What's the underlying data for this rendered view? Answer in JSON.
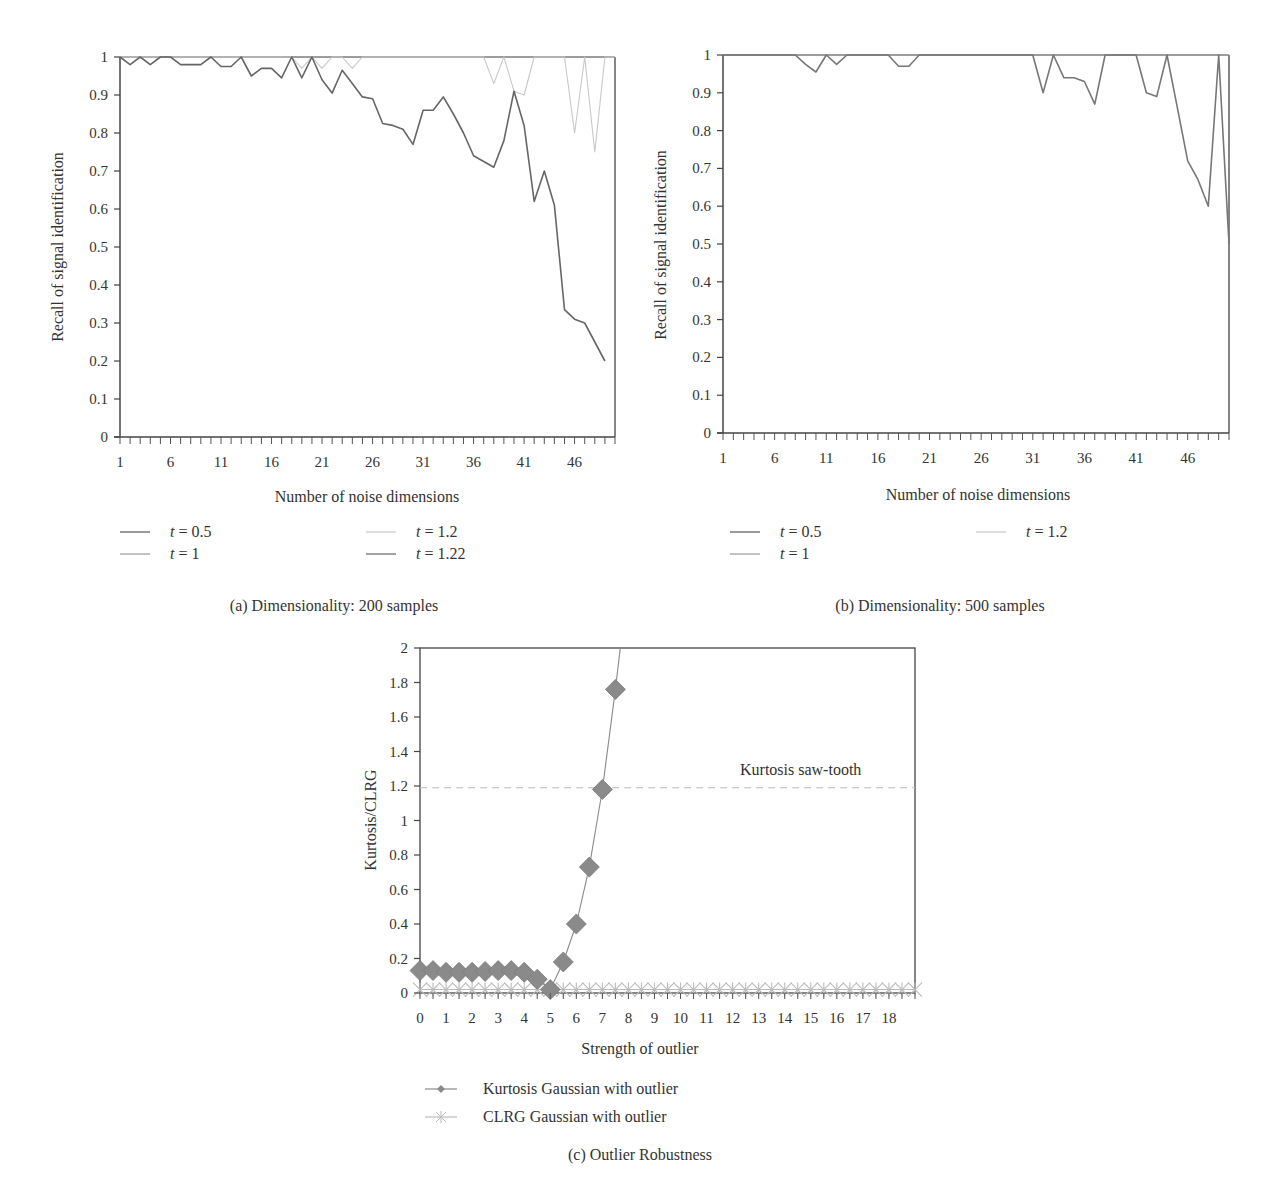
{
  "chart_data": [
    {
      "id": "a",
      "type": "line",
      "caption": "(a)  Dimensionality: 200 samples",
      "xlabel": "Number of noise dimensions",
      "ylabel": "Recall of signal identification",
      "xlim": [
        1,
        50
      ],
      "ylim": [
        0,
        1
      ],
      "x_tick_labels": [
        "1",
        "6",
        "11",
        "16",
        "21",
        "26",
        "31",
        "36",
        "41",
        "46"
      ],
      "y_tick_labels": [
        "0",
        "0.1",
        "0.2",
        "0.3",
        "0.4",
        "0.5",
        "0.6",
        "0.7",
        "0.8",
        "0.9",
        "1"
      ],
      "x": [
        1,
        2,
        3,
        4,
        5,
        6,
        7,
        8,
        9,
        10,
        11,
        12,
        13,
        14,
        15,
        16,
        17,
        18,
        19,
        20,
        21,
        22,
        23,
        24,
        25,
        26,
        27,
        28,
        29,
        30,
        31,
        32,
        33,
        34,
        35,
        36,
        37,
        38,
        39,
        40,
        41,
        42,
        43,
        44,
        45,
        46,
        47,
        48,
        49,
        50
      ],
      "legend": [
        {
          "label_var": "t",
          "label_value": " = 0.5",
          "color": "#555555"
        },
        {
          "label_var": "t",
          "label_value": " = 1",
          "color": "#999999"
        },
        {
          "label_var": "t",
          "label_value": " = 1.2",
          "color": "#c8c8c8"
        },
        {
          "label_var": "t",
          "label_value": " = 1.22",
          "color": "#666666"
        }
      ],
      "series": [
        {
          "name": "t = 0.5",
          "color": "#555555",
          "values": [
            1,
            1,
            1,
            1,
            1,
            1,
            1,
            1,
            1,
            1,
            1,
            1,
            1,
            1,
            1,
            1,
            1,
            1,
            1,
            1,
            1,
            1,
            1,
            1,
            1,
            1,
            1,
            1,
            1,
            1,
            1,
            1,
            1,
            1,
            1,
            1,
            1,
            1,
            1,
            1,
            1,
            1,
            1,
            1,
            1,
            1,
            1,
            1,
            1,
            1
          ]
        },
        {
          "name": "t = 1",
          "color": "#999999",
          "values": [
            1,
            1,
            1,
            1,
            1,
            1,
            1,
            1,
            1,
            1,
            1,
            1,
            1,
            1,
            1,
            1,
            1,
            1,
            1,
            1,
            1,
            1,
            1,
            1,
            1,
            1,
            1,
            1,
            1,
            1,
            1,
            1,
            1,
            1,
            1,
            1,
            1,
            1,
            1,
            1,
            1,
            1,
            1,
            1,
            1,
            1,
            1,
            1,
            1,
            1
          ]
        },
        {
          "name": "t = 1.2",
          "color": "#c8c8c8",
          "values": [
            1,
            1,
            1,
            1,
            1,
            1,
            1,
            1,
            1,
            1,
            1,
            1,
            1,
            1,
            1,
            1,
            1,
            1,
            0.97,
            1,
            0.97,
            1,
            1,
            0.97,
            1,
            1,
            1,
            1,
            1,
            1,
            1,
            1,
            1,
            1,
            1,
            1,
            1,
            0.93,
            1,
            0.91,
            0.9,
            1,
            1,
            1,
            1,
            0.8,
            1,
            0.75,
            1,
            1
          ]
        },
        {
          "name": "t = 1.22",
          "color": "#666666",
          "values": [
            1,
            0.98,
            1,
            0.98,
            1,
            1,
            0.98,
            0.98,
            0.98,
            1,
            0.975,
            0.975,
            1,
            0.95,
            0.97,
            0.97,
            0.945,
            1,
            0.945,
            1,
            0.94,
            0.905,
            0.965,
            0.93,
            0.895,
            0.89,
            0.825,
            0.82,
            0.81,
            0.77,
            0.86,
            0.86,
            0.895,
            0.85,
            0.8,
            0.74,
            0.725,
            0.71,
            0.78,
            0.91,
            0.82,
            0.62,
            0.7,
            0.61,
            0.335,
            0.31,
            0.3,
            0.25,
            0.2,
            null
          ]
        }
      ]
    },
    {
      "id": "b",
      "type": "line",
      "caption": "(b)  Dimensionality: 500 samples",
      "xlabel": "Number of noise dimensions",
      "ylabel": "Recall of signal identification",
      "xlim": [
        1,
        50
      ],
      "ylim": [
        0,
        1
      ],
      "x_tick_labels": [
        "1",
        "6",
        "11",
        "16",
        "21",
        "26",
        "31",
        "36",
        "41",
        "46"
      ],
      "y_tick_labels": [
        "0",
        "0.1",
        "0.2",
        "0.3",
        "0.4",
        "0.5",
        "0.6",
        "0.7",
        "0.8",
        "0.9",
        "1"
      ],
      "x": [
        1,
        2,
        3,
        4,
        5,
        6,
        7,
        8,
        9,
        10,
        11,
        12,
        13,
        14,
        15,
        16,
        17,
        18,
        19,
        20,
        21,
        22,
        23,
        24,
        25,
        26,
        27,
        28,
        29,
        30,
        31,
        32,
        33,
        34,
        35,
        36,
        37,
        38,
        39,
        40,
        41,
        42,
        43,
        44,
        45,
        46,
        47,
        48,
        49,
        50
      ],
      "legend": [
        {
          "label_var": "t",
          "label_value": " = 0.5",
          "color": "#555555"
        },
        {
          "label_var": "t",
          "label_value": " = 1",
          "color": "#999999"
        },
        {
          "label_var": "t",
          "label_value": " = 1.2",
          "color": "#c8c8c8"
        }
      ],
      "series": [
        {
          "name": "t = 0.5",
          "color": "#555555",
          "values": [
            1,
            1,
            1,
            1,
            1,
            1,
            1,
            1,
            1,
            1,
            1,
            1,
            1,
            1,
            1,
            1,
            1,
            1,
            1,
            1,
            1,
            1,
            1,
            1,
            1,
            1,
            1,
            1,
            1,
            1,
            1,
            1,
            1,
            1,
            1,
            1,
            1,
            1,
            1,
            1,
            1,
            1,
            1,
            1,
            1,
            1,
            1,
            1,
            1,
            1
          ]
        },
        {
          "name": "t = 1",
          "color": "#999999",
          "values": [
            1,
            1,
            1,
            1,
            1,
            1,
            1,
            1,
            1,
            1,
            1,
            1,
            1,
            1,
            1,
            1,
            1,
            1,
            1,
            1,
            1,
            1,
            1,
            1,
            1,
            1,
            1,
            1,
            1,
            1,
            1,
            1,
            1,
            1,
            1,
            1,
            1,
            1,
            1,
            1,
            1,
            1,
            1,
            1,
            1,
            1,
            1,
            1,
            1,
            1
          ]
        },
        {
          "name": "t = 1.2",
          "color": "#777777",
          "values": [
            1,
            1,
            1,
            1,
            1,
            1,
            1,
            1,
            0.975,
            0.955,
            1,
            0.975,
            1,
            1,
            1,
            1,
            1,
            0.97,
            0.97,
            1,
            1,
            1,
            1,
            1,
            1,
            1,
            1,
            1,
            1,
            1,
            1,
            0.9,
            1,
            0.94,
            0.94,
            0.93,
            0.87,
            1,
            1,
            1,
            1,
            0.9,
            0.89,
            1,
            0.86,
            0.72,
            0.67,
            0.6,
            1,
            0.5
          ]
        }
      ]
    },
    {
      "id": "c",
      "type": "line",
      "caption": "(c)  Outlier Robustness",
      "xlabel": "Strength of outlier",
      "ylabel": "Kurtosis/CLRG",
      "xlim": [
        0,
        19
      ],
      "ylim": [
        0,
        2
      ],
      "x_tick_labels": [
        "0",
        "1",
        "2",
        "3",
        "4",
        "5",
        "6",
        "7",
        "8",
        "9",
        "10",
        "11",
        "12",
        "13",
        "14",
        "15",
        "16",
        "17",
        "18"
      ],
      "y_tick_labels": [
        "0",
        "0.2",
        "0.4",
        "0.6",
        "0.8",
        "1",
        "1.2",
        "1.4",
        "1.6",
        "1.8",
        "2"
      ],
      "annotation": {
        "text": "Kurtosis saw-tooth",
        "y": 1.19,
        "color": "#bbbbbb"
      },
      "legend": [
        {
          "label": "Kurtosis Gaussian with outlier",
          "marker": "diamond",
          "color": "#8a8a8a"
        },
        {
          "label": "CLRG Gaussian with outlier",
          "marker": "asterisk",
          "color": "#bbbbbb"
        }
      ],
      "series": [
        {
          "name": "Kurtosis Gaussian with outlier",
          "marker": "diamond",
          "color": "#8a8a8a",
          "x": [
            0,
            0.5,
            1,
            1.5,
            2,
            2.5,
            3,
            3.5,
            4,
            4.5,
            5,
            5.5,
            6,
            6.5,
            7,
            7.5,
            8
          ],
          "values": [
            0.13,
            0.13,
            0.12,
            0.12,
            0.12,
            0.125,
            0.13,
            0.13,
            0.12,
            0.08,
            0.02,
            0.18,
            0.4,
            0.73,
            1.18,
            1.76,
            2.4
          ]
        },
        {
          "name": "CLRG Gaussian with outlier",
          "marker": "asterisk",
          "color": "#bbbbbb",
          "x": [
            0,
            0.5,
            1,
            1.5,
            2,
            2.5,
            3,
            3.5,
            4,
            4.5,
            5,
            5.5,
            6,
            6.5,
            7,
            7.5,
            8,
            8.5,
            9,
            9.5,
            10,
            10.5,
            11,
            11.5,
            12,
            12.5,
            13,
            13.5,
            14,
            14.5,
            15,
            15.5,
            16,
            16.5,
            17,
            17.5,
            18,
            18.5,
            19
          ],
          "values": [
            0.02,
            0.02,
            0.02,
            0.02,
            0.02,
            0.02,
            0.02,
            0.02,
            0.02,
            0.02,
            0.02,
            0.02,
            0.02,
            0.02,
            0.02,
            0.02,
            0.02,
            0.02,
            0.02,
            0.02,
            0.02,
            0.02,
            0.02,
            0.02,
            0.02,
            0.02,
            0.02,
            0.02,
            0.02,
            0.02,
            0.02,
            0.02,
            0.02,
            0.02,
            0.02,
            0.02,
            0.02,
            0.02,
            0.02
          ]
        }
      ]
    }
  ]
}
